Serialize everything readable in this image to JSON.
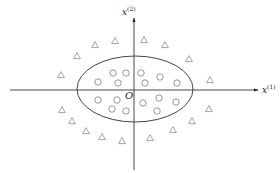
{
  "diagram": {
    "title": "",
    "axes": {
      "x": {
        "label_base": "x",
        "label_sup": "(1)",
        "from": [
          10,
          90
        ],
        "to": [
          258,
          90
        ]
      },
      "y": {
        "label_base": "x",
        "label_sup": "(2)",
        "from": [
          134,
          170
        ],
        "to": [
          134,
          18
        ]
      }
    },
    "origin_label": "O",
    "boundary": {
      "shape": "ellipse",
      "cx": 135,
      "cy": 89,
      "rx": 58,
      "ry": 33
    },
    "colors": {
      "axis": "#333333",
      "ellipse": "#444444",
      "circle_marker": "#8a8a8a",
      "triangle_marker": "#9a9a9a",
      "label": "#222222"
    },
    "classes": [
      {
        "name": "circle",
        "marker": "o",
        "points": [
          [
            113,
            73
          ],
          [
            126,
            73
          ],
          [
            98,
            82
          ],
          [
            118,
            83
          ],
          [
            141,
            73
          ],
          [
            160,
            77
          ],
          [
            145,
            83
          ],
          [
            177,
            83
          ],
          [
            98,
            100
          ],
          [
            117,
            100
          ],
          [
            112,
            109
          ],
          [
            126,
            111
          ],
          [
            143,
            103
          ],
          [
            159,
            98
          ],
          [
            176,
            102
          ],
          [
            157,
            111
          ]
        ]
      },
      {
        "name": "triangle",
        "marker": "^",
        "points": [
          [
            61,
            75
          ],
          [
            77,
            56
          ],
          [
            95,
            45
          ],
          [
            115,
            41
          ],
          [
            144,
            40
          ],
          [
            165,
            45
          ],
          [
            189,
            59
          ],
          [
            210,
            80
          ],
          [
            62,
            110
          ],
          [
            72,
            121
          ],
          [
            86,
            131
          ],
          [
            102,
            137
          ],
          [
            122,
            141
          ],
          [
            150,
            138
          ],
          [
            173,
            130
          ],
          [
            192,
            121
          ],
          [
            209,
            109
          ]
        ]
      }
    ]
  }
}
